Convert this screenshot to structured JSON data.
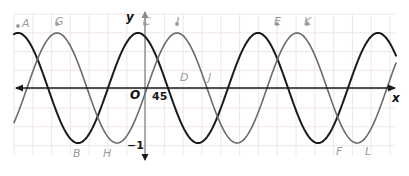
{
  "figure": {
    "kind": "trigonometric-graph",
    "background": "#ffffff",
    "grid": {
      "x": 14,
      "y": 14,
      "width": 381,
      "height": 141,
      "cell": 18.8,
      "line_color": "#f0e4e6",
      "visible": true
    },
    "axes": {
      "x_axis": {
        "label": "x",
        "label_x": 392,
        "label_y": 93,
        "y_pixel": 88,
        "x_start": 395,
        "x_end": 16,
        "arrow_left": true,
        "arrow_right": true,
        "color": "#1a1a1a"
      },
      "y_axis": {
        "label": "y",
        "label_x": 126,
        "label_y": 12,
        "x_pixel": 145,
        "y_start": 12,
        "y_end": 160,
        "arrow_up": true,
        "arrow_down": true,
        "color": "#8a8a8a"
      },
      "origin": {
        "label": "O",
        "x": 130,
        "y": 90
      }
    },
    "annotations": [
      {
        "name": "x-tick-45",
        "text": "45",
        "x": 152,
        "y": 91,
        "color": "#1a1a1a"
      },
      {
        "name": "y-value-minus-one",
        "text": "−1",
        "x": 127,
        "y": 140,
        "color": "#1a1a1a"
      }
    ],
    "curves": [
      {
        "name": "black-curve",
        "color": "#1a1a1a",
        "width": 2.0,
        "amplitude": 55,
        "period": 120,
        "phase_peak_x": 18,
        "midline_y": 88
      },
      {
        "name": "gray-curve",
        "color": "#6b6b6b",
        "width": 1.6,
        "amplitude": 55,
        "period": 120,
        "phase_peak_x": 57,
        "midline_y": 88
      }
    ],
    "points": [
      {
        "label": "A",
        "x": 22,
        "y": 18,
        "curve": "black",
        "type": "maximum"
      },
      {
        "label": "G",
        "x": 55,
        "y": 16,
        "curve": "gray",
        "type": "maximum"
      },
      {
        "label": "C",
        "x": 143,
        "y": 16,
        "curve": "black",
        "type": "maximum"
      },
      {
        "label": "I",
        "x": 176,
        "y": 16,
        "curve": "gray",
        "type": "maximum"
      },
      {
        "label": "E",
        "x": 274,
        "y": 16,
        "curve": "black",
        "type": "maximum"
      },
      {
        "label": "K",
        "x": 304,
        "y": 16,
        "curve": "gray",
        "type": "maximum"
      },
      {
        "label": "B",
        "x": 73,
        "y": 148,
        "curve": "black",
        "type": "minimum"
      },
      {
        "label": "H",
        "x": 103,
        "y": 148,
        "curve": "gray",
        "type": "minimum"
      },
      {
        "label": "F",
        "x": 336,
        "y": 146,
        "curve": "black",
        "type": "minimum"
      },
      {
        "label": "L",
        "x": 365,
        "y": 146,
        "curve": "gray",
        "type": "minimum"
      },
      {
        "label": "D",
        "x": 180,
        "y": 72,
        "curve": "gray",
        "type": "intercept"
      },
      {
        "label": "J",
        "x": 208,
        "y": 72,
        "curve": "gray",
        "type": "intercept"
      }
    ],
    "markers": [
      {
        "name": "marker-a",
        "x": 18,
        "y": 26,
        "color": "#9a9a9a"
      },
      {
        "name": "marker-g",
        "x": 57,
        "y": 24,
        "color": "#9a9a9a"
      },
      {
        "name": "marker-c",
        "x": 145,
        "y": 24,
        "color": "#9a9a9a"
      },
      {
        "name": "marker-i",
        "x": 177,
        "y": 24,
        "color": "#9a9a9a"
      },
      {
        "name": "marker-e",
        "x": 277,
        "y": 24,
        "color": "#9a9a9a"
      },
      {
        "name": "marker-k",
        "x": 307,
        "y": 24,
        "color": "#9a9a9a"
      }
    ]
  }
}
